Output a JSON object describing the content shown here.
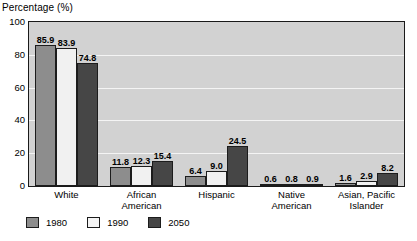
{
  "chart_data": {
    "type": "bar",
    "title": "",
    "xlabel": "",
    "ylabel": "Percentage (%)",
    "ylim": [
      0,
      100
    ],
    "yticks": [
      0,
      20,
      40,
      60,
      80,
      100
    ],
    "grid": true,
    "legend_position": "bottom-left",
    "categories": [
      "White",
      "African\nAmerican",
      "Hispanic",
      "Native\nAmerican",
      "Asian, Pacific\nIslander"
    ],
    "series": [
      {
        "name": "1980",
        "color": "#8d8d8d",
        "values": [
          85.9,
          11.8,
          6.4,
          0.6,
          1.6
        ]
      },
      {
        "name": "1990",
        "color": "#f1f1f1",
        "values": [
          83.9,
          12.3,
          9.0,
          0.8,
          2.9
        ]
      },
      {
        "name": "2050",
        "color": "#464646",
        "values": [
          74.8,
          15.4,
          24.5,
          0.9,
          8.2
        ]
      }
    ],
    "value_labels": [
      [
        "85.9",
        "83.9",
        "74.8"
      ],
      [
        "11.8",
        "12.3",
        "15.4"
      ],
      [
        "6.4",
        "9.0",
        "24.5"
      ],
      [
        "0.6",
        "0.8",
        "0.9"
      ],
      [
        "1.6",
        "2.9",
        "8.2"
      ]
    ]
  },
  "axis": {
    "y_title": "Percentage (%)",
    "y_tick_labels": [
      "100",
      "80",
      "60",
      "40",
      "20",
      "0"
    ]
  },
  "legend": {
    "items": [
      {
        "label": "1980"
      },
      {
        "label": "1990"
      },
      {
        "label": "2050"
      }
    ]
  },
  "colors": {
    "plot_background": "#d2d2d2",
    "gridline": "#f4f4f4",
    "axis_border": "#1a1a1a",
    "series_1980": "#8d8d8d",
    "series_1990": "#f1f1f1",
    "series_2050": "#464646"
  }
}
